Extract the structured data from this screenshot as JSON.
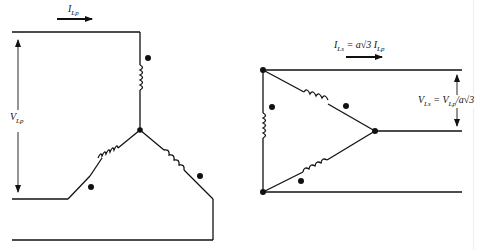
{
  "figure": {
    "left": {
      "title": "Wye-connected primary",
      "current_label": {
        "main": "I",
        "sub": "Lp"
      },
      "voltage_label": {
        "main": "V",
        "sub": "Lp"
      }
    },
    "right": {
      "title": "Delta-connected secondary",
      "current_label": {
        "main": "I",
        "sub": "Ls",
        "eq": " = a√3 I",
        "sub2": "Lp"
      },
      "voltage_label": {
        "main": "V",
        "sub": "Ls",
        "eq": " = V",
        "sub2": "Lp",
        "tail": "/a√3"
      }
    },
    "colors": {
      "ink": "#111111",
      "background": "#ffffff"
    }
  }
}
